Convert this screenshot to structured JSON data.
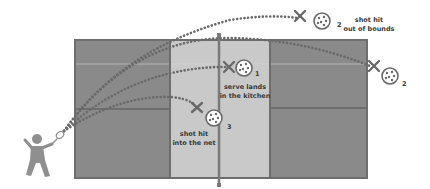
{
  "diagram": {
    "colors": {
      "court_outer": "#8a8a8a",
      "kitchen": "#c9c9c9",
      "court_line": "#6e6e6e",
      "trajectory": "#6a6a6a",
      "player": "#8f8f8f",
      "text": "#3a3a3a"
    },
    "faults": [
      {
        "number": "1",
        "label_line1": "serve lands",
        "label_line2": "in the kitchen"
      },
      {
        "number": "2",
        "label_line1": "shot hit",
        "label_line2": "out of bounds"
      },
      {
        "number": "2",
        "label_line1": "",
        "label_line2": ""
      },
      {
        "number": "3",
        "label_line1": "shot hit",
        "label_line2": "into the net"
      }
    ]
  }
}
